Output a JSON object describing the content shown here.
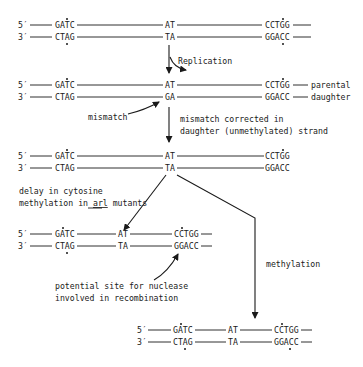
{
  "figure": {
    "labels": {
      "five_prime": "5′",
      "three_prime": "3′"
    },
    "stage1": {
      "top": {
        "site1": "GATC",
        "mid": "AT",
        "site2": "CCTGG"
      },
      "bottom": {
        "site1": "CTAG",
        "mid": "TA",
        "site2": "GGACC"
      }
    },
    "replication_label": "Replication",
    "stage2": {
      "top": {
        "site1": "GATC",
        "mid": "AT",
        "site2": "CCTGG",
        "strand": "parental"
      },
      "bottom": {
        "site1": "CTAG",
        "mid": "GA",
        "site2": "GGACC",
        "strand": "daughter"
      }
    },
    "mismatch_label": "mismatch",
    "correction_label_line1": "mismatch corrected in",
    "correction_label_line2": "daughter (unmethylated) strand",
    "stage3": {
      "top": {
        "site1": "GATC",
        "mid": "AT",
        "site2": "CCTGG"
      },
      "bottom": {
        "site1": "CTAG",
        "mid": "TA",
        "site2": "GGACC"
      }
    },
    "delay_label_line1": "delay in cytosine",
    "delay_label_line2_pre": "methylation in ",
    "delay_label_line2_gene": "arl",
    "delay_label_line2_post": " mutants",
    "stage4a": {
      "top": {
        "site1": "GATC",
        "mid": "AT",
        "site2": "CCTGG"
      },
      "bottom": {
        "site1": "CTAG",
        "mid": "TA",
        "site2": "GGACC"
      }
    },
    "nuclease_label_line1": "potential site for nuclease",
    "nuclease_label_line2": "involved in recombination",
    "methylation_label": "methylation",
    "stage4b": {
      "top": {
        "site1": "GATC",
        "mid": "AT",
        "site2": "CCTGG"
      },
      "bottom": {
        "site1": "CTAG",
        "mid": "TA",
        "site2": "GGACC"
      }
    }
  }
}
